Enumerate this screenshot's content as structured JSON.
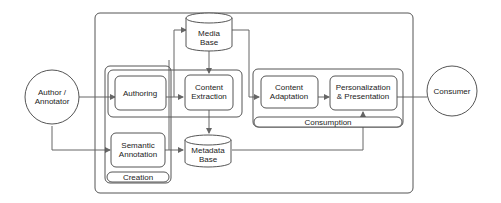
{
  "diagram": {
    "nodes": {
      "author": {
        "label_line1": "Author /",
        "label_line2": "Annotator",
        "shape": "circle"
      },
      "consumer": {
        "label": "Consumer",
        "shape": "circle"
      },
      "authoring": {
        "label": "Authoring",
        "shape": "rounded-rect"
      },
      "semantic_annotation": {
        "label_line1": "Semantic",
        "label_line2": "Annotation",
        "shape": "rounded-rect"
      },
      "content_extraction": {
        "label_line1": "Content",
        "label_line2": "Extraction",
        "shape": "rounded-rect"
      },
      "media_base": {
        "label_line1": "Media",
        "label_line2": "Base",
        "shape": "cylinder"
      },
      "metadata_base": {
        "label_line1": "Metadata",
        "label_line2": "Base",
        "shape": "cylinder"
      },
      "content_adaptation": {
        "label_line1": "Content",
        "label_line2": "Adaptation",
        "shape": "rounded-rect"
      },
      "personalization": {
        "label_line1": "Personalization",
        "label_line2": "& Presentation",
        "shape": "rounded-rect"
      }
    },
    "groups": {
      "creation": {
        "label": "Creation"
      },
      "consumption": {
        "label": "Consumption"
      }
    },
    "edges": [
      {
        "from": "author",
        "to": "authoring"
      },
      {
        "from": "author",
        "to": "semantic_annotation"
      },
      {
        "from": "authoring",
        "to": "content_extraction"
      },
      {
        "from": "media_base",
        "to": "content_extraction"
      },
      {
        "from": "content_extraction",
        "to": "metadata_base"
      },
      {
        "from": "semantic_annotation",
        "to": "metadata_base"
      },
      {
        "from": "authoring",
        "to": "media_base"
      },
      {
        "from": "media_base",
        "to": "content_adaptation"
      },
      {
        "from": "metadata_base",
        "to": "personalization"
      },
      {
        "from": "content_adaptation",
        "to": "personalization"
      },
      {
        "from": "personalization",
        "to": "consumer"
      }
    ],
    "colors": {
      "stroke": "#555555",
      "connector": "#666666",
      "text": "#222222",
      "background": "#ffffff"
    }
  }
}
